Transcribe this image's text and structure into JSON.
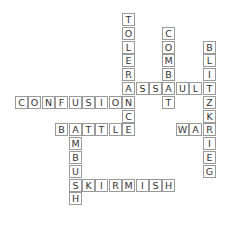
{
  "puzzle": {
    "type": "crossword",
    "origin_x": 15,
    "origin_y": 13,
    "cell_w": 13.4,
    "cell_h": 13.8,
    "words": [
      {
        "word": "TOLERANCE",
        "dir": "down",
        "col": 8,
        "row": 0
      },
      {
        "word": "COMBAT",
        "dir": "down",
        "col": 11,
        "row": 1
      },
      {
        "word": "BLITZKRIEG",
        "dir": "down",
        "col": 14,
        "row": 2
      },
      {
        "word": "ASSAULT",
        "dir": "across",
        "col": 8,
        "row": 5
      },
      {
        "word": "CONFUSION",
        "dir": "across",
        "col": 0,
        "row": 6
      },
      {
        "word": "BATTLE",
        "dir": "across",
        "col": 3,
        "row": 8
      },
      {
        "word": "WAR",
        "dir": "across",
        "col": 12,
        "row": 8
      },
      {
        "word": "AMBUSH",
        "dir": "down",
        "col": 4,
        "row": 8
      },
      {
        "word": "SKIRMISH",
        "dir": "across",
        "col": 4,
        "row": 12
      }
    ]
  }
}
